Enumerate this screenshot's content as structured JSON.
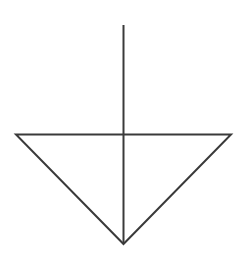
{
  "diagram": {
    "symbol": "ground-symbol",
    "stroke_color": "#3a3a3a",
    "background": "#ffffff",
    "stem": {
      "x": 123,
      "y1": 25,
      "y2": 244
    },
    "triangle": {
      "left": [
        16,
        134
      ],
      "right": [
        231,
        134
      ],
      "apex": [
        123,
        244
      ]
    }
  }
}
